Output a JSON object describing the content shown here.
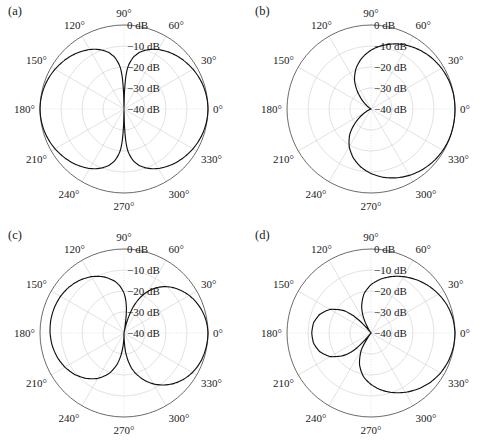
{
  "figure": {
    "width": 493,
    "height": 447,
    "background": "#ffffff",
    "grid_color": "#c9c9c9",
    "curve_color": "#111111",
    "axis_color": "#3a3a3a"
  },
  "common": {
    "angle_labels": [
      "0°",
      "30°",
      "60°",
      "90°",
      "120°",
      "150°",
      "180°",
      "210°",
      "240°",
      "270°",
      "300°",
      "330°"
    ],
    "angle_values": [
      0,
      30,
      60,
      90,
      120,
      150,
      180,
      210,
      240,
      270,
      300,
      330
    ],
    "radial_labels": [
      "0 dB",
      "−10 dB",
      "−20 dB",
      "−30 dB",
      "−40 dB"
    ],
    "radial_values": [
      0,
      -10,
      -20,
      -30,
      -40
    ],
    "r_min_db": -40,
    "r_max_db": 0,
    "grid": "on",
    "ring_count": 5,
    "spoke_step_deg": 30
  },
  "panels": [
    {
      "id": "a",
      "label": "(a)",
      "position": {
        "left": 0,
        "top": 0
      },
      "center": {
        "x": 124,
        "y": 109
      },
      "radius": 84,
      "chart_data": {
        "type": "line",
        "plot_kind": "polar-radiation-pattern",
        "title": "(a)",
        "xlabel": "",
        "ylabel": "",
        "rlim": [
          -40,
          0
        ],
        "runits": "dB",
        "theta_deg": [
          0,
          5,
          10,
          15,
          20,
          25,
          30,
          35,
          40,
          45,
          50,
          55,
          60,
          65,
          70,
          75,
          80,
          85,
          88,
          90,
          92,
          95,
          100,
          105,
          110,
          115,
          120,
          125,
          130,
          135,
          140,
          145,
          150,
          155,
          160,
          165,
          170,
          175,
          180,
          185,
          190,
          195,
          200,
          205,
          210,
          215,
          220,
          225,
          230,
          235,
          240,
          245,
          250,
          255,
          260,
          265,
          268,
          270,
          272,
          275,
          280,
          285,
          290,
          295,
          300,
          305,
          310,
          315,
          320,
          325,
          330,
          335,
          340,
          345,
          350,
          355,
          360
        ],
        "r_db": [
          0,
          -0.1,
          -0.3,
          -0.6,
          -1.0,
          -1.5,
          -2.1,
          -2.8,
          -3.5,
          -4.3,
          -5.2,
          -6.2,
          -7.3,
          -8.6,
          -10.2,
          -12.2,
          -15.0,
          -20.0,
          -28.0,
          -45.0,
          -28.0,
          -20.0,
          -15.0,
          -12.2,
          -10.2,
          -8.6,
          -7.3,
          -6.2,
          -5.2,
          -4.3,
          -3.5,
          -2.8,
          -2.1,
          -1.5,
          -1.0,
          -0.6,
          -0.3,
          -0.1,
          0,
          -0.1,
          -0.3,
          -0.6,
          -1.0,
          -1.5,
          -2.1,
          -2.8,
          -3.5,
          -4.3,
          -5.2,
          -6.2,
          -7.3,
          -8.6,
          -10.2,
          -12.2,
          -15.0,
          -20.0,
          -28.0,
          -45.0,
          -28.0,
          -20.0,
          -15.0,
          -12.2,
          -10.2,
          -8.6,
          -7.3,
          -6.2,
          -5.2,
          -4.3,
          -3.5,
          -2.8,
          -2.1,
          -1.5,
          -1.0,
          -0.6,
          -0.3,
          -0.1,
          0
        ]
      }
    },
    {
      "id": "b",
      "label": "(b)",
      "position": {
        "left": 247,
        "top": 0
      },
      "center": {
        "x": 124,
        "y": 109
      },
      "radius": 84,
      "chart_data": {
        "type": "line",
        "plot_kind": "polar-radiation-pattern",
        "title": "(b)",
        "xlabel": "",
        "ylabel": "",
        "rlim": [
          -40,
          0
        ],
        "runits": "dB",
        "theta_deg": [
          0,
          10,
          20,
          30,
          40,
          50,
          60,
          70,
          80,
          90,
          100,
          110,
          120,
          130,
          140,
          150,
          160,
          165,
          170,
          174,
          177,
          179,
          180,
          181,
          183,
          186,
          190,
          195,
          200,
          210,
          220,
          230,
          240,
          250,
          260,
          270,
          280,
          290,
          300,
          310,
          320,
          330,
          340,
          350,
          360
        ],
        "r_db": [
          0,
          -0.1,
          -0.5,
          -1.2,
          -2.2,
          -3.5,
          -5.1,
          -7.0,
          -9.3,
          -12.0,
          -15.3,
          -19.3,
          -24.3,
          -31.0,
          -37.0,
          -40.0,
          -40.0,
          -40.0,
          -40.0,
          -40.0,
          -40.0,
          -40.0,
          -40.0,
          -40.0,
          -40.0,
          -40.0,
          -40.0,
          -40.0,
          -40.0,
          -37.0,
          -31.0,
          -24.3,
          -19.3,
          -15.3,
          -12.0,
          -9.3,
          -7.0,
          -5.1,
          -3.5,
          -2.2,
          -1.2,
          -0.5,
          -0.1,
          0,
          0
        ]
      }
    },
    {
      "id": "c",
      "label": "(c)",
      "position": {
        "left": 0,
        "top": 224
      },
      "center": {
        "x": 124,
        "y": 109
      },
      "radius": 84,
      "chart_data": {
        "type": "line",
        "plot_kind": "polar-radiation-pattern",
        "title": "(c)",
        "xlabel": "",
        "ylabel": "",
        "rlim": [
          -40,
          0
        ],
        "runits": "dB",
        "theta_deg": [
          0,
          5,
          10,
          15,
          20,
          25,
          30,
          35,
          40,
          45,
          50,
          55,
          60,
          65,
          70,
          72,
          74,
          76,
          78,
          80,
          82,
          84,
          86,
          88,
          90,
          95,
          100,
          110,
          120,
          130,
          140,
          150,
          160,
          170,
          180,
          190,
          200,
          210,
          220,
          230,
          240,
          250,
          258,
          262,
          266,
          268,
          270,
          272,
          274,
          278,
          282,
          286,
          290,
          295,
          300,
          305,
          310,
          315,
          320,
          325,
          330,
          335,
          340,
          345,
          350,
          355,
          360
        ],
        "r_db": [
          0,
          -0.2,
          -0.6,
          -1.2,
          -2.0,
          -3.0,
          -4.2,
          -5.6,
          -7.2,
          -9.0,
          -11.2,
          -13.8,
          -17.0,
          -21.0,
          -26.0,
          -29.0,
          -32.0,
          -35.5,
          -38.5,
          -40.0,
          -34.0,
          -29.0,
          -25.5,
          -23.0,
          -21.0,
          -17.5,
          -15.0,
          -11.5,
          -9.0,
          -7.2,
          -5.9,
          -5.1,
          -4.7,
          -4.6,
          -4.8,
          -5.3,
          -6.2,
          -7.5,
          -9.3,
          -11.8,
          -15.0,
          -19.5,
          -25.0,
          -29.0,
          -34.0,
          -37.0,
          -40.0,
          -36.0,
          -32.0,
          -27.0,
          -23.0,
          -20.0,
          -17.5,
          -14.5,
          -12.0,
          -9.8,
          -7.8,
          -6.1,
          -4.6,
          -3.4,
          -2.4,
          -1.6,
          -1.0,
          -0.6,
          -0.3,
          -0.1,
          0
        ]
      }
    },
    {
      "id": "d",
      "label": "(d)",
      "position": {
        "left": 247,
        "top": 224
      },
      "center": {
        "x": 124,
        "y": 109
      },
      "radius": 84,
      "chart_data": {
        "type": "line",
        "plot_kind": "polar-radiation-pattern",
        "title": "(d)",
        "xlabel": "",
        "ylabel": "",
        "rlim": [
          -40,
          0
        ],
        "runits": "dB",
        "theta_deg": [
          0,
          10,
          20,
          30,
          40,
          50,
          60,
          70,
          80,
          90,
          100,
          110,
          115,
          120,
          125,
          128,
          130,
          132,
          135,
          140,
          150,
          160,
          170,
          180,
          190,
          200,
          210,
          220,
          225,
          228,
          230,
          232,
          235,
          240,
          250,
          260,
          270,
          280,
          290,
          300,
          310,
          320,
          330,
          340,
          350,
          360
        ],
        "r_db": [
          0,
          -0.4,
          -1.4,
          -2.9,
          -4.7,
          -6.8,
          -9.0,
          -11.4,
          -14.0,
          -17.0,
          -21.0,
          -27.0,
          -31.0,
          -36.0,
          -40.0,
          -40.0,
          -38.0,
          -34.0,
          -29.0,
          -23.5,
          -17.5,
          -14.0,
          -12.2,
          -11.8,
          -12.2,
          -14.0,
          -17.5,
          -23.5,
          -28.0,
          -33.0,
          -38.0,
          -40.0,
          -38.0,
          -31.0,
          -24.0,
          -19.0,
          -15.5,
          -12.5,
          -9.8,
          -7.4,
          -5.2,
          -3.3,
          -1.8,
          -0.8,
          -0.2,
          0
        ]
      }
    }
  ]
}
